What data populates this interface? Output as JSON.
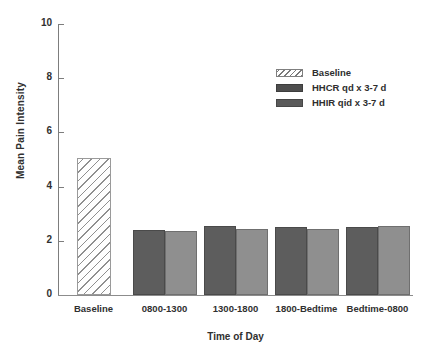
{
  "chart_data": {
    "type": "bar",
    "title": "",
    "xlabel": "Time of Day",
    "ylabel": "Mean Pain Intensity",
    "ylim": [
      0,
      10
    ],
    "ytick_values": [
      10,
      8,
      6,
      4,
      2,
      0
    ],
    "ytick_labels": [
      "10",
      "8",
      "6",
      "4",
      "2",
      "0"
    ],
    "grid": false,
    "legend_position": "upper right",
    "categories": [
      "Baseline",
      "0800-1300",
      "1300-1800",
      "1800-Bedtime",
      "Bedtime-0800"
    ],
    "series": [
      {
        "name": "Baseline",
        "style": "hatched",
        "color": "#ffffff",
        "values": [
          5.05,
          null,
          null,
          null,
          null
        ]
      },
      {
        "name": "HHCR qd x 3-7 d",
        "style": "solid-dark",
        "color": "#5d5d5d",
        "values": [
          null,
          2.4,
          2.55,
          2.5,
          2.5
        ]
      },
      {
        "name": "HHIR qid x 3-7 d",
        "style": "solid-light",
        "color": "#8f8f8f",
        "values": [
          null,
          2.35,
          2.45,
          2.45,
          2.55
        ]
      }
    ]
  },
  "axes": {
    "y_title": "Mean Pain Intensity",
    "x_title": "Time of Day",
    "y_ticks": [
      {
        "label": "10",
        "value": 10
      },
      {
        "label": "8",
        "value": 8
      },
      {
        "label": "6",
        "value": 6
      },
      {
        "label": "4",
        "value": 4
      },
      {
        "label": "2",
        "value": 2
      },
      {
        "label": "0",
        "value": 0
      }
    ],
    "x_ticks": [
      {
        "label": "Baseline"
      },
      {
        "label": "0800-1300"
      },
      {
        "label": "1300-1800"
      },
      {
        "label": "1800-Bedtime"
      },
      {
        "label": "Bedtime-0800"
      }
    ]
  },
  "legend": {
    "entries": [
      {
        "label": "Baseline",
        "swatch": "hatched-swatch"
      },
      {
        "label": "HHCR qd x 3-7 d",
        "swatch": "dark-gray-swatch"
      },
      {
        "label": "HHIR qid x 3-7 d",
        "swatch": "medium-gray-swatch"
      }
    ]
  }
}
